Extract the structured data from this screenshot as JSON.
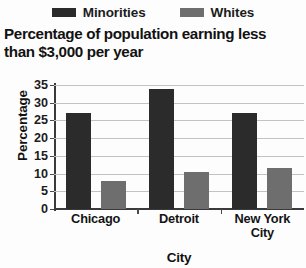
{
  "chart_data": {
    "type": "bar",
    "title": "Percentage of population earning less than $3,000 per year",
    "title_line1": "Percentage of population earning less",
    "title_line2": "than $3,000 per year",
    "xlabel": "City",
    "ylabel": "Percentage",
    "categories": [
      "Chicago",
      "Detroit",
      "New York City"
    ],
    "category_lines": [
      [
        "Chicago"
      ],
      [
        "Detroit"
      ],
      [
        "New York",
        "City"
      ]
    ],
    "series": [
      {
        "name": "Minorities",
        "color": "#2b2b2b",
        "values": [
          27,
          34,
          27
        ]
      },
      {
        "name": "Whites",
        "color": "#6e6e6e",
        "values": [
          8,
          10.5,
          11.5
        ]
      }
    ],
    "ylim": [
      0,
      35
    ],
    "ytick_step": 5,
    "yticks": [
      35,
      30,
      25,
      20,
      15,
      10,
      5,
      0
    ],
    "grid": true,
    "legend_position": "top"
  },
  "legend": {
    "entries": [
      {
        "label": "Minorities",
        "swatch": "dark-swatch"
      },
      {
        "label": "Whites",
        "swatch": "gray-swatch"
      }
    ]
  }
}
